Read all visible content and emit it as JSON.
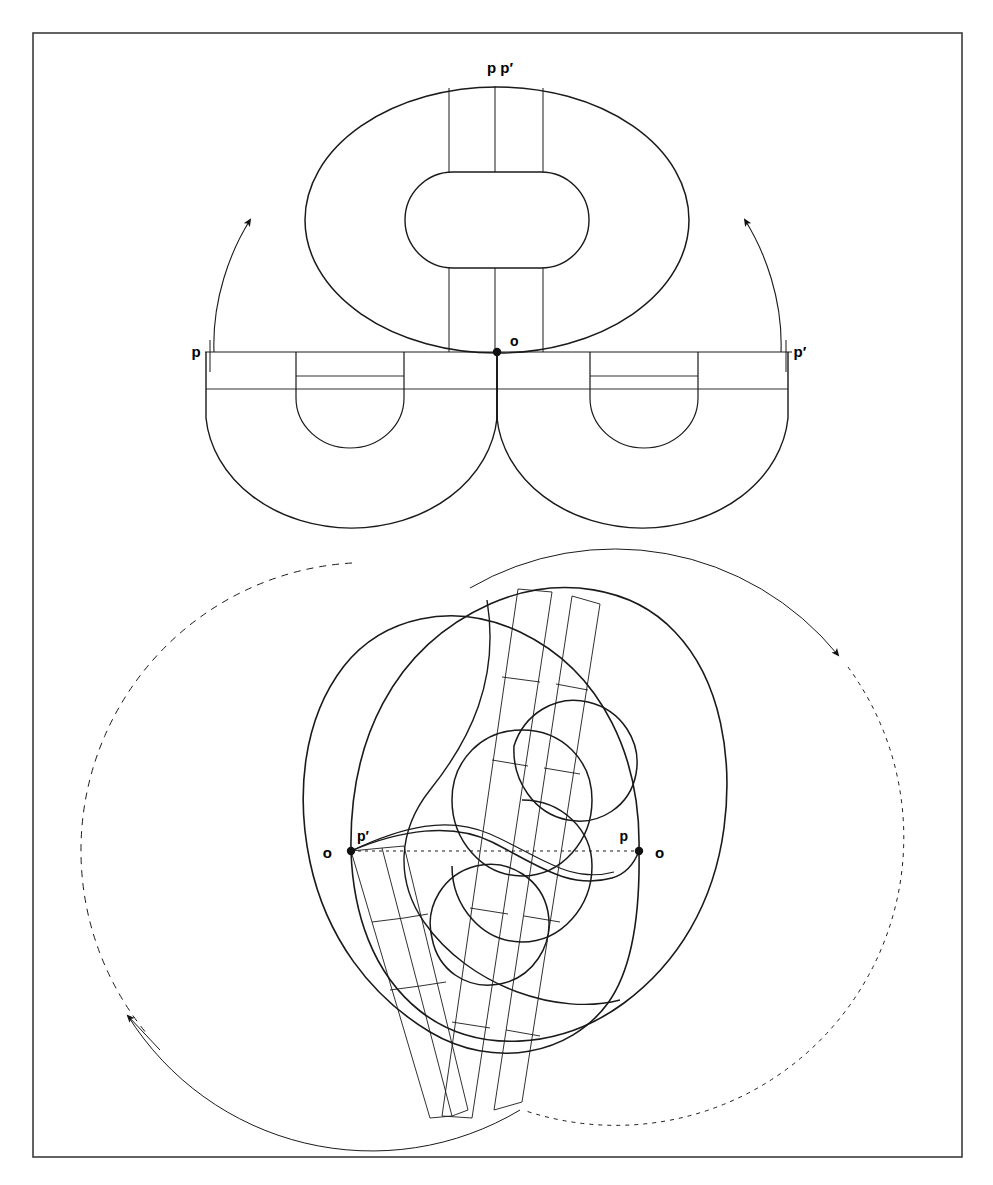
{
  "page": {
    "background_color": "#ffffff",
    "ink_color": "#1a1a1a",
    "border_color": "#3c3c3c"
  },
  "frame": {
    "name": "plate-border",
    "x": 33,
    "y": 33,
    "width": 929,
    "height": 1124,
    "stroke_width": 1.6
  },
  "top_figure": {
    "name": "upper-diagram",
    "caption_labels": [
      {
        "id": "pp-top",
        "text": "p p′",
        "x": 500,
        "y": 73
      },
      {
        "id": "p-left",
        "text": "p",
        "x": 196,
        "y": 357
      },
      {
        "id": "p-right",
        "text": "p′",
        "x": 800,
        "y": 357
      },
      {
        "id": "o-center",
        "text": "o",
        "x": 510,
        "y": 346
      }
    ],
    "marked_points": [
      {
        "id": "o-dot",
        "x": 497,
        "y": 352,
        "r": 4.2
      }
    ],
    "axis_line": {
      "x1": 205,
      "y1": 352,
      "x2": 792,
      "y2": 352
    },
    "outer_ring": {
      "cx": 497,
      "cy": 220,
      "rx": 192,
      "ry": 135
    },
    "inner_ring": {
      "cx": 497,
      "cy": 220,
      "rx": 92,
      "ry": 48
    },
    "band_x_positions": [
      449,
      495,
      543
    ],
    "band_top_y": 85,
    "lower_lobes": [
      {
        "id": "left-lobe",
        "cx": 350,
        "cy": 415,
        "rx": 147,
        "ry": 118
      },
      {
        "id": "right-lobe",
        "cx": 644,
        "cy": 415,
        "rx": 147,
        "ry": 118
      }
    ],
    "lobe_inner": [
      {
        "id": "left-lobe-inner",
        "cx": 350,
        "cy": 400,
        "rx": 54,
        "ry": 48
      },
      {
        "id": "right-lobe-inner",
        "cx": 644,
        "cy": 400,
        "rx": 54,
        "ry": 48
      }
    ],
    "rotation_arrows": [
      {
        "id": "arrow-left",
        "direction": "counterclockwise-up",
        "tip_x": 248,
        "tip_y": 216
      },
      {
        "id": "arrow-right",
        "direction": "clockwise-up",
        "tip_x": 747,
        "tip_y": 216
      }
    ]
  },
  "bottom_figure": {
    "name": "lower-diagram",
    "caption_labels": [
      {
        "id": "o-far-left",
        "text": "o",
        "x": 332,
        "y": 858
      },
      {
        "id": "p-prime-left",
        "text": "p′",
        "x": 360,
        "y": 841
      },
      {
        "id": "p-right",
        "text": "p",
        "x": 622,
        "y": 841
      },
      {
        "id": "o-far-right",
        "text": "o",
        "x": 653,
        "y": 858
      }
    ],
    "marked_points": [
      {
        "id": "left-dot",
        "x": 351,
        "y": 851,
        "r": 4.2
      },
      {
        "id": "right-dot",
        "x": 639,
        "y": 851,
        "r": 4.2
      }
    ],
    "chord_dotted_line": {
      "x1": 351,
      "y1": 851,
      "x2": 639,
      "y2": 851
    },
    "big_left_circle": {
      "cx": 352,
      "cy": 851,
      "r": 288,
      "style": "dashed-with-solid-tail"
    },
    "big_right_circle": {
      "cx": 639,
      "cy": 851,
      "r": 288,
      "style": "dotted-with-solid-head"
    },
    "rotation_arrows": [
      {
        "id": "arrow-upper-right",
        "tip_x": 845,
        "tip_y": 661
      },
      {
        "id": "arrow-lower-left",
        "tip_x": 122,
        "tip_y": 1029
      }
    ],
    "band_angle_deg": 22
  },
  "legend_note": {
    "symbols": [
      "p",
      "p′",
      "o"
    ],
    "description": "points marked on the surface and on the rotation axis"
  }
}
